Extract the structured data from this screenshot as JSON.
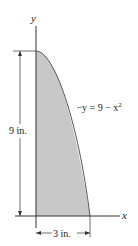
{
  "diagram": {
    "y_axis_label": "y",
    "x_axis_label": "x",
    "curve_label": "y = 9 − x",
    "curve_label_exponent": "2",
    "height_dimension": "9 in.",
    "width_dimension": "3 in.",
    "region_fill": "#c8c8c8",
    "line_color": "#333333"
  }
}
